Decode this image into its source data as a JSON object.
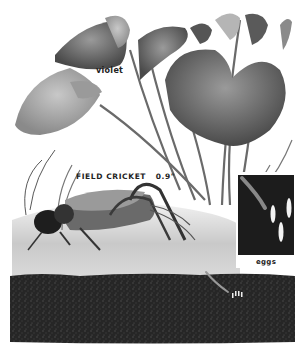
{
  "illustration": {
    "plant_label": "violet",
    "insect_label": "FIELD CRICKET",
    "insect_size": "0.9\"",
    "inset_label": "eggs"
  },
  "colors": {
    "background": "#ffffff",
    "leaf_dark": "#5a5a5a",
    "leaf_light": "#a8a8a8",
    "soil": "#262626",
    "ground": "#d8d8d8",
    "inset_bg": "#1a1a1a",
    "egg": "#f2f2f2"
  }
}
